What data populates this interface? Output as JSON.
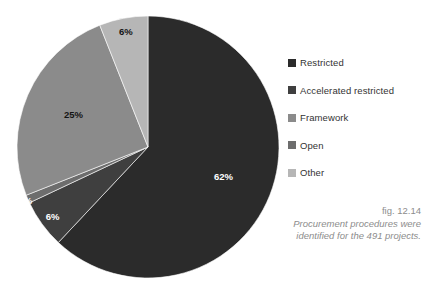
{
  "chart_data": {
    "type": "pie",
    "title": "",
    "subtitle": "",
    "xlabel": "",
    "ylabel": "",
    "legend_position": "right",
    "grid": false,
    "total_label": "491 projects",
    "categories": [
      "Restricted",
      "Accelerated restricted",
      "Framework",
      "Open",
      "Other"
    ],
    "values": [
      62,
      6,
      25,
      1,
      6
    ],
    "value_labels": [
      "62%",
      "6%",
      "25%",
      "1%",
      "6%"
    ],
    "colors": [
      "#2b2b2b",
      "#3f3f3f",
      "#8b8b8b",
      "#6d6d6d",
      "#b6b6b6"
    ],
    "slices": [
      {
        "label": "Restricted",
        "value": 62,
        "value_label": "62%",
        "color": "#2b2b2b",
        "start_pct": 0,
        "label_color": "#ffffff"
      },
      {
        "label": "Accelerated restricted",
        "value": 6,
        "value_label": "6%",
        "color": "#3f3f3f",
        "start_pct": 62,
        "label_color": "#ffffff"
      },
      {
        "label": "Open",
        "value": 1,
        "value_label": "1%",
        "color": "#6d6d6d",
        "start_pct": 68,
        "label_color": "#ffffff"
      },
      {
        "label": "Framework",
        "value": 25,
        "value_label": "25%",
        "color": "#8b8b8b",
        "start_pct": 69,
        "label_color": "#141414"
      },
      {
        "label": "Other",
        "value": 6,
        "value_label": "6%",
        "color": "#b6b6b6",
        "start_pct": 94,
        "label_color": "#141414"
      }
    ]
  },
  "legend": {
    "items": [
      {
        "label": "Restricted",
        "color": "#2b2b2b"
      },
      {
        "label": "Accelerated restricted",
        "color": "#3f3f3f"
      },
      {
        "label": "Framework",
        "color": "#8b8b8b"
      },
      {
        "label": "Open",
        "color": "#6d6d6d"
      },
      {
        "label": "Other",
        "color": "#b6b6b6"
      }
    ]
  },
  "caption": {
    "figure_number": "fig. 12.14",
    "text": "Procurement procedures were identified for the 491 projects."
  }
}
